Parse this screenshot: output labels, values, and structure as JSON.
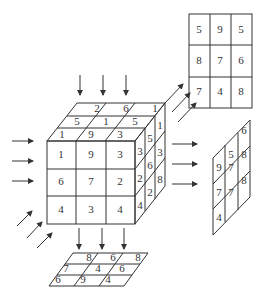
{
  "diagram": {
    "cube": {
      "front_face": [
        [
          "1",
          "9",
          "3"
        ],
        [
          "6",
          "7",
          "2"
        ],
        [
          "4",
          "3",
          "4"
        ]
      ],
      "top_face": [
        [
          "2",
          "6",
          "1"
        ],
        [
          "5",
          "1",
          "5"
        ],
        [
          "1",
          "9",
          "3"
        ]
      ],
      "right_face": [
        [
          "3",
          "5",
          "1"
        ],
        [
          "2",
          "6",
          "3"
        ],
        [
          "4",
          "2",
          "8"
        ]
      ]
    },
    "projections": {
      "back_face": [
        [
          "5",
          "9",
          "5"
        ],
        [
          "8",
          "7",
          "6"
        ],
        [
          "7",
          "4",
          "8"
        ]
      ],
      "right_side_face": [
        [
          "9",
          "5",
          "6"
        ],
        [
          "7",
          "7",
          "8"
        ],
        [
          "4",
          "7",
          "8"
        ]
      ],
      "bottom_face": [
        [
          "8",
          "6",
          "8"
        ],
        [
          "7",
          "4",
          "6"
        ],
        [
          "6",
          "9",
          "4"
        ]
      ]
    },
    "arrows": {
      "top_down": 3,
      "left_right": 3,
      "right_out": 3,
      "bottom_down": 3,
      "diagonal_back": 3
    },
    "colors": {
      "line": "#333333",
      "background": "#ffffff"
    }
  }
}
